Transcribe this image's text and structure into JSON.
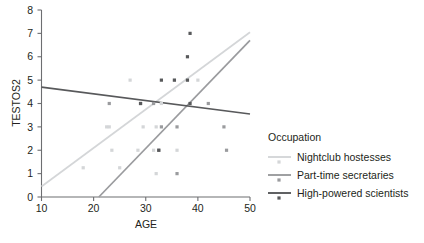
{
  "chart_data": {
    "type": "scatter",
    "title": "",
    "xlabel": "AGE",
    "ylabel": "TESTOS2",
    "xlim": [
      10,
      50
    ],
    "ylim": [
      0,
      8
    ],
    "xticks": [
      10,
      20,
      30,
      40,
      50
    ],
    "yticks": [
      0,
      1,
      2,
      3,
      4,
      5,
      6,
      7,
      8
    ],
    "grid": false,
    "legend_position": "right",
    "legend_title": "Occupation",
    "series": [
      {
        "name": "Nightclub hostesses",
        "color": "#d4d6d8",
        "marker": "square-dot",
        "points": [
          [
            18,
            1.25
          ],
          [
            22.5,
            3.0
          ],
          [
            23,
            3.0
          ],
          [
            23.5,
            2.0
          ],
          [
            25,
            1.25
          ],
          [
            27,
            5.0
          ],
          [
            28.5,
            2.0
          ],
          [
            29.5,
            3.0
          ],
          [
            31.5,
            2.0
          ],
          [
            32,
            3.0
          ],
          [
            32,
            1.0
          ],
          [
            33,
            4.0
          ],
          [
            35.5,
            5.0
          ],
          [
            36,
            2.0
          ],
          [
            38,
            5.0
          ],
          [
            40,
            5.0
          ]
        ],
        "fit_line": {
          "x": [
            10,
            50
          ],
          "y": [
            0.45,
            7.05
          ]
        }
      },
      {
        "name": "Part-time secretaries",
        "color": "#9a9b9e",
        "marker": "square-dot",
        "points": [
          [
            23,
            4.0
          ],
          [
            29,
            4.0
          ],
          [
            31.5,
            4.0
          ],
          [
            32.5,
            2.0
          ],
          [
            33,
            3.0
          ],
          [
            36,
            3.0
          ],
          [
            36,
            1.0
          ],
          [
            42,
            4.0
          ],
          [
            45,
            3.0
          ],
          [
            45.5,
            2.0
          ]
        ],
        "fit_line": {
          "x": [
            21,
            50
          ],
          "y": [
            0,
            6.7
          ]
        }
      },
      {
        "name": "High-powered scientists",
        "color": "#58595b",
        "marker": "square-dot",
        "points": [
          [
            33,
            5.0
          ],
          [
            35.5,
            5.0
          ],
          [
            38,
            5.0
          ],
          [
            38,
            6.0
          ],
          [
            38.5,
            7.0
          ],
          [
            38.5,
            4.0
          ],
          [
            29,
            4.0
          ],
          [
            32.5,
            2.0
          ]
        ],
        "fit_line": {
          "x": [
            10,
            50
          ],
          "y": [
            4.7,
            3.55
          ]
        }
      }
    ]
  },
  "axes": {
    "y_title": "TESTOS2",
    "x_title": "AGE",
    "x_tick_labels": [
      "10",
      "20",
      "30",
      "40",
      "50"
    ],
    "y_tick_labels": [
      "0",
      "1",
      "2",
      "3",
      "4",
      "5",
      "6",
      "7",
      "8"
    ]
  },
  "legend": {
    "title": "Occupation",
    "entries": [
      {
        "label": "Nightclub hostesses",
        "color": "#d4d6d8"
      },
      {
        "label": "Part-time secretaries",
        "color": "#9a9b9e"
      },
      {
        "label": "High-powered scientists",
        "color": "#58595b"
      }
    ]
  },
  "colors": {
    "axis": "#6d6e71",
    "text": "#231f20",
    "background": "#ffffff"
  }
}
